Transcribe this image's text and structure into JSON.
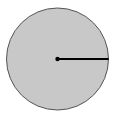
{
  "diagram": {
    "type": "circle-with-radius",
    "circle": {
      "cx": 57.5,
      "cy": 59,
      "r": 51,
      "fill": "#c8c8c8",
      "stroke": "#555555"
    },
    "center_point": {
      "cx": 57.5,
      "cy": 59,
      "r": 2.2,
      "fill": "#000000"
    },
    "radius_line": {
      "x1": 57.5,
      "y1": 59,
      "x2": 108.5,
      "y2": 59,
      "stroke": "#000000",
      "width": 2
    }
  }
}
